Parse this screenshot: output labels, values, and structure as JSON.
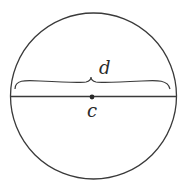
{
  "diagram": {
    "labels": {
      "diameter": "d",
      "center": "c"
    },
    "geometry": {
      "circle": {
        "cx": 93.5,
        "cy": 96,
        "r": 83
      },
      "diameter_line": {
        "x1": 10.5,
        "y1": 96.5,
        "x2": 176.5,
        "y2": 96.5
      },
      "center_point": {
        "cx": 92,
        "cy": 97,
        "r": 2.4
      }
    },
    "colors": {
      "stroke": "#3a3a3a",
      "background": "#ffffff"
    }
  }
}
